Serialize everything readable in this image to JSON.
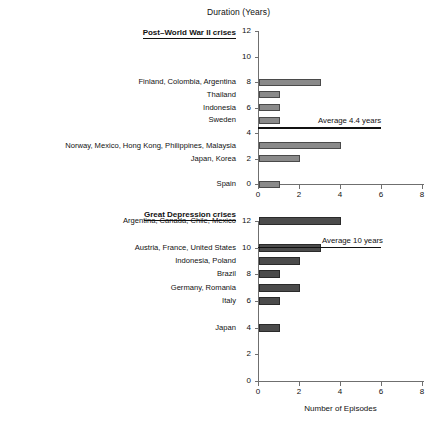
{
  "figure": {
    "top_axis_title": "Duration (Years)",
    "bottom_axis_title": "Number of Episodes"
  },
  "panels": {
    "top": {
      "heading": "Post–World War II crises",
      "average_label": "Average 4.4 years",
      "ytick_labels": [
        "0",
        "2",
        "4",
        "6",
        "8",
        "10",
        "12"
      ],
      "xtick_labels": [
        "0",
        "2",
        "4",
        "6",
        "8"
      ],
      "categories": [
        {
          "label": "Finland, Colombia, Argentina",
          "duration": 8,
          "episodes": 3
        },
        {
          "label": "Thailand",
          "duration": 7,
          "episodes": 1
        },
        {
          "label": "Indonesia",
          "duration": 6,
          "episodes": 1
        },
        {
          "label": "Sweden",
          "duration": 5,
          "episodes": 1
        },
        {
          "label": "Norway, Mexico, Hong Kong, Philippines, Malaysia",
          "duration": 3,
          "episodes": 4
        },
        {
          "label": "Japan, Korea",
          "duration": 2,
          "episodes": 2
        },
        {
          "label": "Spain",
          "duration": 0,
          "episodes": 1
        }
      ]
    },
    "bottom": {
      "heading": "Great Depression crises",
      "average_label": "Average 10 years",
      "ytick_labels": [
        "0",
        "2",
        "4",
        "6",
        "8",
        "10",
        "12"
      ],
      "xtick_labels": [
        "0",
        "2",
        "4",
        "6",
        "8"
      ],
      "categories": [
        {
          "label": "Argentina, Canada, Chile, Mexico",
          "duration": 12,
          "episodes": 4
        },
        {
          "label": "Austria, France, United States",
          "duration": 10,
          "episodes": 3
        },
        {
          "label": "Indonesia, Poland",
          "duration": 9,
          "episodes": 2
        },
        {
          "label": "Brazil",
          "duration": 8,
          "episodes": 1
        },
        {
          "label": "Germany, Romania",
          "duration": 7,
          "episodes": 2
        },
        {
          "label": "Italy",
          "duration": 6,
          "episodes": 1
        },
        {
          "label": "Japan",
          "duration": 4,
          "episodes": 1
        }
      ]
    }
  },
  "chart_data": {
    "type": "bar",
    "orientation": "horizontal",
    "title": "",
    "xlabel": "Number of Episodes",
    "ylabel": "Duration (Years)",
    "xlim": [
      0,
      8
    ],
    "ylim": [
      0,
      12
    ],
    "grid": false,
    "legend": "none",
    "panels": [
      {
        "name": "Post–World War II crises",
        "xlabel": "",
        "ylabel": "Duration (Years)",
        "xlim": [
          0,
          8
        ],
        "ylim": [
          0,
          12
        ],
        "xticks": [
          0,
          2,
          4,
          6,
          8
        ],
        "yticks": [
          0,
          2,
          4,
          6,
          8,
          10,
          12
        ],
        "categories": [
          "Finland, Colombia, Argentina",
          "Thailand",
          "Indonesia",
          "Sweden",
          "Norway, Mexico, Hong Kong, Philippines, Malaysia",
          "Japan, Korea",
          "Spain"
        ],
        "durations": [
          8,
          7,
          6,
          5,
          3,
          2,
          0
        ],
        "values": [
          3,
          1,
          1,
          1,
          4,
          2,
          1
        ],
        "annotations": [
          {
            "text": "Average 4.4 years",
            "y": 4.4,
            "x_from": 0,
            "x_to": 6,
            "type": "horizontal-line"
          }
        ]
      },
      {
        "name": "Great Depression crises",
        "xlabel": "Number of Episodes",
        "ylabel": "Duration (Years)",
        "xlim": [
          0,
          8
        ],
        "ylim": [
          0,
          12
        ],
        "xticks": [
          0,
          2,
          4,
          6,
          8
        ],
        "yticks": [
          0,
          2,
          4,
          6,
          8,
          10,
          12
        ],
        "categories": [
          "Argentina, Canada, Chile, Mexico",
          "Austria, France, United States",
          "Indonesia, Poland",
          "Brazil",
          "Germany, Romania",
          "Italy",
          "Japan"
        ],
        "durations": [
          12,
          10,
          9,
          8,
          7,
          6,
          4
        ],
        "values": [
          4,
          3,
          2,
          1,
          2,
          1,
          1
        ],
        "annotations": [
          {
            "text": "Average 10 years",
            "y": 10,
            "x_from": 0,
            "x_to": 6,
            "type": "horizontal-line"
          }
        ]
      }
    ]
  }
}
